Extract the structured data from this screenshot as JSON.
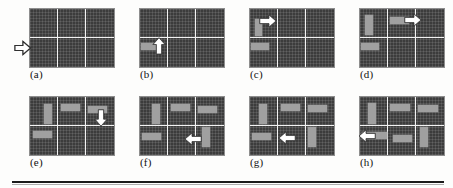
{
  "figure": {
    "panel_count": 8,
    "rows": 2,
    "cols": 4,
    "board": {
      "cols": 3,
      "rows": 2,
      "cell_color": "#3c3c3c",
      "grid_line_color": "#f2f2f2",
      "piece_color": "#a0a0a0",
      "arrow_color": "#ffffff"
    },
    "rule_color": "#1b1b1b"
  },
  "panels": [
    {
      "id": "a",
      "label": "(a)",
      "arrow": {
        "name": "hollow-arrow-right",
        "direction": "right",
        "style": "outline"
      },
      "pieces": []
    },
    {
      "id": "b",
      "label": "(b)",
      "arrow": {
        "name": "arrow-up",
        "direction": "up",
        "style": "solid"
      },
      "pieces": [
        {
          "orientation": "horizontal",
          "cell": "bottom-left"
        }
      ]
    },
    {
      "id": "c",
      "label": "(c)",
      "arrow": {
        "name": "arrow-right",
        "direction": "right",
        "style": "solid"
      },
      "pieces": [
        {
          "orientation": "vertical",
          "cell": "top-left"
        },
        {
          "orientation": "horizontal",
          "cell": "bottom-left"
        }
      ]
    },
    {
      "id": "d",
      "label": "(d)",
      "arrow": {
        "name": "arrow-right",
        "direction": "right",
        "style": "solid"
      },
      "pieces": [
        {
          "orientation": "vertical",
          "cell": "top-left"
        },
        {
          "orientation": "horizontal",
          "cell": "top-middle"
        },
        {
          "orientation": "horizontal",
          "cell": "bottom-left"
        }
      ]
    },
    {
      "id": "e",
      "label": "(e)",
      "arrow": {
        "name": "arrow-down",
        "direction": "down",
        "style": "solid"
      },
      "pieces": [
        {
          "orientation": "vertical",
          "cell": "top-left"
        },
        {
          "orientation": "horizontal",
          "cell": "top-middle"
        },
        {
          "orientation": "horizontal",
          "cell": "top-right"
        },
        {
          "orientation": "horizontal",
          "cell": "bottom-left"
        }
      ]
    },
    {
      "id": "f",
      "label": "(f)",
      "arrow": {
        "name": "arrow-left",
        "direction": "left",
        "style": "solid"
      },
      "pieces": [
        {
          "orientation": "vertical",
          "cell": "top-left"
        },
        {
          "orientation": "horizontal",
          "cell": "top-middle"
        },
        {
          "orientation": "horizontal",
          "cell": "top-right"
        },
        {
          "orientation": "horizontal",
          "cell": "bottom-left"
        },
        {
          "orientation": "vertical",
          "cell": "bottom-right"
        }
      ]
    },
    {
      "id": "g",
      "label": "(g)",
      "arrow": {
        "name": "arrow-left",
        "direction": "left",
        "style": "solid"
      },
      "pieces": [
        {
          "orientation": "vertical",
          "cell": "top-left"
        },
        {
          "orientation": "horizontal",
          "cell": "top-middle"
        },
        {
          "orientation": "horizontal",
          "cell": "top-right"
        },
        {
          "orientation": "horizontal",
          "cell": "bottom-left"
        },
        {
          "orientation": "vertical",
          "cell": "bottom-right"
        }
      ]
    },
    {
      "id": "h",
      "label": "(h)",
      "arrow": {
        "name": "arrow-left",
        "direction": "left",
        "style": "solid"
      },
      "pieces": [
        {
          "orientation": "vertical",
          "cell": "top-left"
        },
        {
          "orientation": "horizontal",
          "cell": "top-middle"
        },
        {
          "orientation": "horizontal",
          "cell": "top-right"
        },
        {
          "orientation": "horizontal",
          "cell": "bottom-left"
        },
        {
          "orientation": "horizontal",
          "cell": "bottom-middle"
        },
        {
          "orientation": "vertical",
          "cell": "bottom-right"
        }
      ]
    }
  ]
}
